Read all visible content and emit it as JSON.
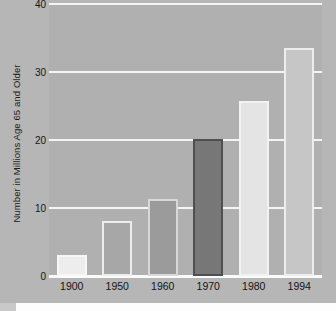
{
  "chart_data": {
    "type": "bar",
    "title": "",
    "xlabel": "",
    "ylabel": "Number in Millions Age 65 and Older",
    "categories": [
      "1900",
      "1950",
      "1960",
      "1970",
      "1980",
      "1994"
    ],
    "values": [
      3.1,
      8.1,
      11.3,
      20.1,
      25.8,
      33.6
    ],
    "ylim": [
      0,
      40
    ],
    "yticks": [
      "0",
      "10",
      "20",
      "30",
      "40"
    ],
    "ytick_values": [
      0,
      10,
      20,
      30,
      40
    ],
    "grid": true,
    "legend": "none",
    "series_name": "Population Age 65 and Older",
    "bar_colors": [
      "#ededed",
      "#a7a7a7",
      "#9b9b9b",
      "#777777",
      "#e4e4e4",
      "#c6c6c6"
    ],
    "bar_border_colors": [
      "#f7f7f7",
      "#ededed",
      "#d8d8d8",
      "#4f4f4f",
      "#f2f2f2",
      "#ededed"
    ],
    "background_color": "#b0b0b0",
    "figure_color": "#b6b6b6",
    "gridline_color": "#f4f4f4",
    "text_color": "#151515"
  }
}
